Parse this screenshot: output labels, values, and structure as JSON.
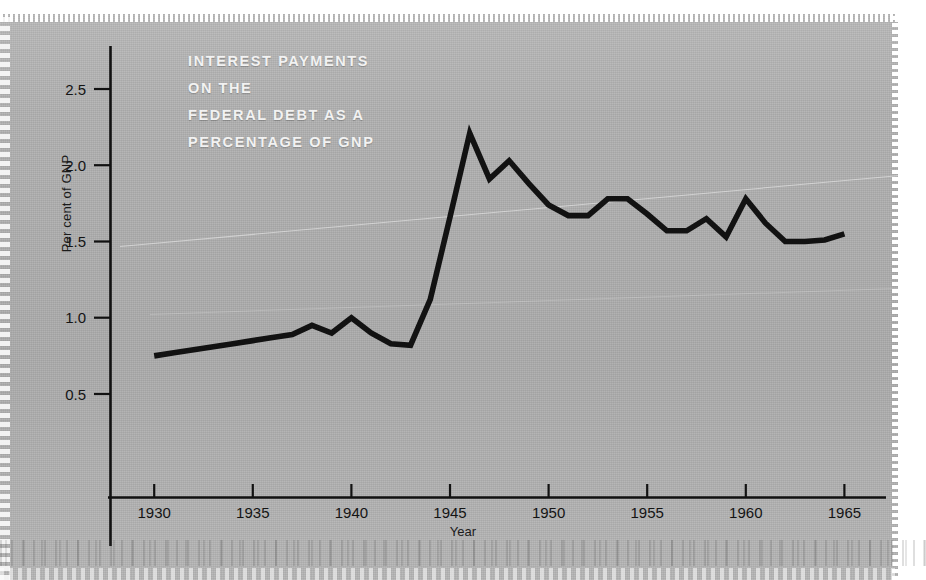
{
  "figure": {
    "background_color": "#b2b2b2",
    "ink_color": "#121212",
    "title_color": "#f2f2f2"
  },
  "title": {
    "line1": "INTEREST PAYMENTS",
    "line2": "ON THE",
    "line3": "FEDERAL DEBT AS A",
    "line4": "PERCENTAGE OF GNP"
  },
  "axes": {
    "xlabel": "Year",
    "ylabel": "Per cent of GNP",
    "x_ticks": [
      "1930",
      "1935",
      "1940",
      "1945",
      "1950",
      "1955",
      "1960",
      "1965"
    ],
    "y_ticks": [
      "0.5",
      "1.0",
      "1.5",
      "2.0",
      "2.5"
    ]
  },
  "chart_data": {
    "type": "line",
    "title": "INTEREST PAYMENTS ON THE FEDERAL DEBT AS A PERCENTAGE OF GNP",
    "xlabel": "Year",
    "ylabel": "Per cent of GNP",
    "xlim": [
      1930,
      1965
    ],
    "ylim": [
      0.0,
      2.75
    ],
    "x_ticks": [
      1930,
      1935,
      1940,
      1945,
      1950,
      1955,
      1960,
      1965
    ],
    "y_ticks": [
      0.5,
      1.0,
      1.5,
      2.0,
      2.5
    ],
    "grid": false,
    "legend": "none",
    "series": [
      {
        "name": "Interest payments on the federal debt as a percentage of GNP",
        "color": "#121212",
        "x": [
          1930,
          1931,
          1932,
          1933,
          1934,
          1935,
          1936,
          1937,
          1938,
          1939,
          1940,
          1941,
          1942,
          1943,
          1944,
          1945,
          1946,
          1947,
          1948,
          1949,
          1950,
          1951,
          1952,
          1953,
          1954,
          1955,
          1956,
          1957,
          1958,
          1959,
          1960,
          1961,
          1962,
          1963,
          1964,
          1965
        ],
        "y": [
          0.75,
          0.77,
          0.79,
          0.81,
          0.83,
          0.85,
          0.87,
          0.89,
          0.95,
          0.9,
          1.0,
          0.9,
          0.83,
          0.82,
          1.12,
          1.66,
          2.21,
          1.91,
          2.03,
          1.88,
          1.74,
          1.67,
          1.67,
          1.78,
          1.78,
          1.68,
          1.57,
          1.57,
          1.65,
          1.53,
          1.78,
          1.62,
          1.5,
          1.5,
          1.51,
          1.55
        ]
      }
    ]
  }
}
